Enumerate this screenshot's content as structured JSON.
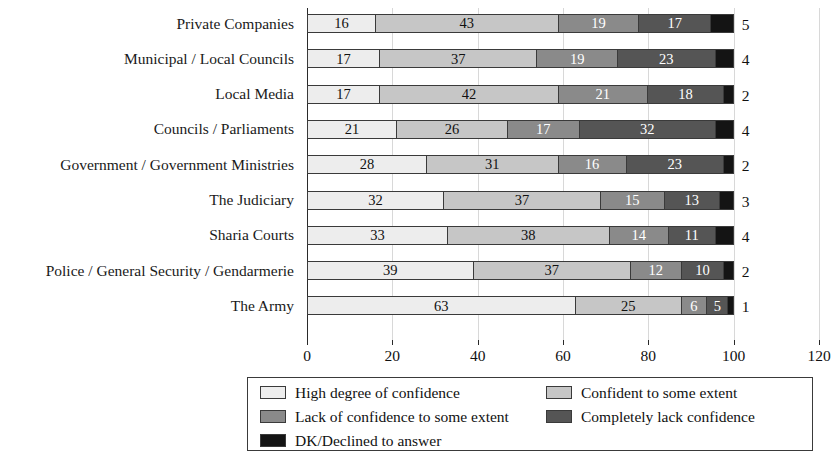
{
  "chart_data": {
    "type": "bar",
    "subtype": "stacked-horizontal-100",
    "title": "",
    "subtitle": "",
    "xlabel": "",
    "ylabel": "",
    "xlim": [
      0,
      120
    ],
    "xticks": [
      "0",
      "20",
      "40",
      "60",
      "80",
      "100",
      "120"
    ],
    "xtick_values": [
      0,
      20,
      40,
      60,
      80,
      100,
      120
    ],
    "grid": true,
    "grid_axis": "x",
    "legend_position": "bottom",
    "categories": [
      "Private Companies",
      "Municipal / Local Councils",
      "Local Media",
      "Councils / Parliaments",
      "Government / Government Ministries",
      "The Judiciary",
      "Sharia Courts",
      "Police / General Security / Gendarmerie",
      "The Army"
    ],
    "series": [
      {
        "name": "High degree of confidence",
        "color": "#ededed",
        "label_color": "#111111",
        "values": [
          16,
          17,
          17,
          21,
          28,
          32,
          33,
          39,
          63
        ]
      },
      {
        "name": "Confident to some extent",
        "color": "#c6c6c6",
        "label_color": "#111111",
        "values": [
          43,
          37,
          42,
          26,
          31,
          37,
          38,
          37,
          25
        ]
      },
      {
        "name": "Lack of confidence to some extent",
        "color": "#8a8a8a",
        "label_color": "#ffffff",
        "values": [
          19,
          19,
          21,
          17,
          16,
          15,
          14,
          12,
          6
        ]
      },
      {
        "name": "Completely lack confidence",
        "color": "#555555",
        "label_color": "#ffffff",
        "values": [
          17,
          23,
          18,
          32,
          23,
          13,
          11,
          10,
          5
        ]
      },
      {
        "name": "DK/Declined to answer",
        "color": "#141414",
        "label_color": "#ffffff",
        "values": [
          5,
          4,
          2,
          4,
          2,
          3,
          4,
          2,
          1
        ],
        "labels_rendered_outside": true
      }
    ],
    "legend_entries": [
      {
        "label": "High degree of confidence",
        "color": "#ededed"
      },
      {
        "label": "Confident to some extent",
        "color": "#c6c6c6"
      },
      {
        "label": "Lack of confidence to some extent",
        "color": "#8a8a8a"
      },
      {
        "label": "Completely lack confidence",
        "color": "#555555"
      },
      {
        "label": "DK/Declined to answer",
        "color": "#141414"
      }
    ]
  }
}
